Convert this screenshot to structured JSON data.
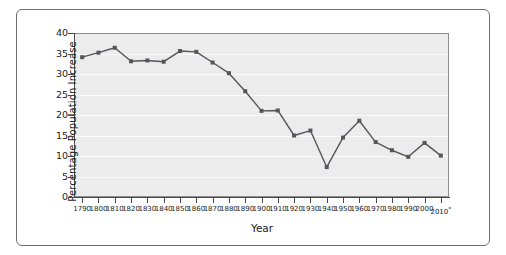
{
  "chart_data": {
    "type": "line",
    "title": "",
    "xlabel": "Year",
    "ylabel": "Percentage Population Increase",
    "xlim": [
      1785,
      2015
    ],
    "ylim": [
      0,
      40
    ],
    "ytick_step": 5,
    "grid": "horizontal",
    "legend": "none",
    "marker": "square",
    "line_color": "#56555a",
    "plot_background": "#ececed",
    "categories": [
      "1790",
      "1800",
      "1810",
      "1820",
      "1830",
      "1840",
      "1850",
      "1860",
      "1870",
      "1880",
      "1890",
      "1900",
      "1910",
      "1920",
      "1930",
      "1940",
      "1950",
      "1960",
      "1970",
      "1980",
      "1990",
      "2000",
      "2010*"
    ],
    "x": [
      1790,
      1800,
      1810,
      1820,
      1830,
      1840,
      1850,
      1860,
      1870,
      1880,
      1890,
      1900,
      1910,
      1920,
      1930,
      1940,
      1950,
      1960,
      1970,
      1980,
      1990,
      2000,
      2010
    ],
    "values": [
      34.1,
      35.2,
      36.4,
      33.1,
      33.3,
      33.0,
      35.6,
      35.4,
      32.8,
      30.2,
      25.8,
      21.0,
      21.1,
      15.0,
      16.2,
      7.3,
      14.5,
      18.6,
      13.4,
      11.4,
      9.8,
      13.2,
      10.1
    ],
    "ytick_labels": [
      "0",
      "5",
      "10",
      "15",
      "20",
      "25",
      "30",
      "35",
      "40"
    ],
    "ytick_values": [
      0,
      5,
      10,
      15,
      20,
      25,
      30,
      35,
      40
    ],
    "annotations": [
      "2010 value marked with asterisk"
    ]
  }
}
